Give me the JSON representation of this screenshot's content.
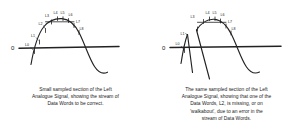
{
  "figure": {
    "zero_axis_label": "0",
    "stroke_color": "#222222",
    "background_color": "#ffffff"
  },
  "panels": [
    {
      "id": "left-panel",
      "name": "correct-data-words-diagram",
      "zero_label": "0",
      "sample_labels": [
        "L0",
        "L1",
        "L2",
        "L3",
        "L4",
        "L5",
        "L6",
        "L7",
        "L8"
      ],
      "caption_lines": [
        "Small sampled section of the Left",
        "Analogue Signal, showing the stream of",
        "Data Words to be correct."
      ]
    },
    {
      "id": "right-panel",
      "name": "missing-data-word-diagram",
      "zero_label": "0",
      "sample_labels": [
        "L0",
        "L1",
        "L3",
        "L4",
        "L5",
        "L6",
        "L7",
        "L8"
      ],
      "missing_label": "L2",
      "caption_lines": [
        "The same sampled section of the Left",
        "Analogue Signal, showing that one of the",
        "Data Words, L2, is missing, or on",
        "'walkabout', due to an error in the",
        "stream of Data Words."
      ]
    }
  ]
}
